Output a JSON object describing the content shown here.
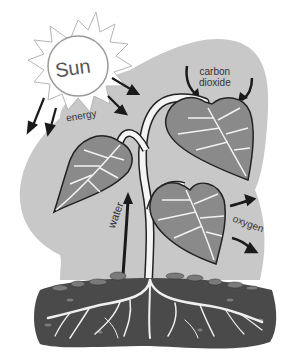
{
  "diagram": {
    "labels": {
      "sun": "Sun",
      "energy": "energy",
      "carbon_dioxide_line1": "carbon",
      "carbon_dioxide_line2": "dioxide",
      "water": "water",
      "oxygen": "oxygen"
    },
    "elements": [
      "sun",
      "plant",
      "leaves",
      "stem",
      "roots",
      "soil",
      "arrows"
    ],
    "colors": {
      "background_blob": "#c8c8c8",
      "leaf_fill": "#8a8a8a",
      "leaf_outline": "#222222",
      "veins": "#f2f2f2",
      "soil": "#4a4a4a",
      "stones": "#7a7a7a",
      "sun_outline": "#9a9a9a",
      "arrows": "#1a1a1a"
    }
  }
}
